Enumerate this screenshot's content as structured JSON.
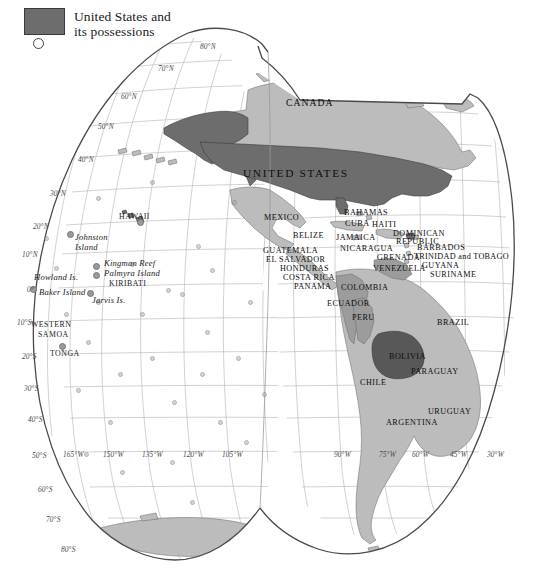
{
  "legend": {
    "swatch_color": "#6d6d6d",
    "label": "United States and\nits possessions",
    "circle_symbol": "small-open-circle"
  },
  "map": {
    "title_region": "Americas and Pacific",
    "projection": "interrupted pseudocylindrical (Goode-style)",
    "colors": {
      "us_possessions": "#6d6d6d",
      "other_land": "#b9b9b9",
      "highlight_bolivia": "#5a5a5a",
      "ocean": "#ffffff",
      "graticule": "#aaaaaa",
      "coastline": "#555555"
    },
    "countries": [
      {
        "name": "CANADA",
        "x": 286,
        "y": 97,
        "size": "mid"
      },
      {
        "name": "UNITED STATES",
        "x": 243,
        "y": 167,
        "size": "big"
      },
      {
        "name": "MEXICO",
        "x": 264,
        "y": 213,
        "size": "normal"
      },
      {
        "name": "BAHAMAS",
        "x": 344,
        "y": 208,
        "size": "normal"
      },
      {
        "name": "CUBA",
        "x": 345,
        "y": 219,
        "size": "normal"
      },
      {
        "name": "HAITI",
        "x": 372,
        "y": 220,
        "size": "normal"
      },
      {
        "name": "DOMINICAN",
        "x": 393,
        "y": 229,
        "size": "normal"
      },
      {
        "name": "REPUBLIC",
        "x": 396,
        "y": 237,
        "size": "normal"
      },
      {
        "name": "BELIZE",
        "x": 293,
        "y": 231,
        "size": "normal"
      },
      {
        "name": "JAMAICA",
        "x": 336,
        "y": 233,
        "size": "normal"
      },
      {
        "name": "GUATEMALA",
        "x": 263,
        "y": 246,
        "size": "normal"
      },
      {
        "name": "NICARAGUA",
        "x": 340,
        "y": 244,
        "size": "normal"
      },
      {
        "name": "EL SALVADOR",
        "x": 266,
        "y": 255,
        "size": "normal"
      },
      {
        "name": "HONDURAS",
        "x": 280,
        "y": 264,
        "size": "normal"
      },
      {
        "name": "COSTA RICA",
        "x": 283,
        "y": 273,
        "size": "normal"
      },
      {
        "name": "PANAMA",
        "x": 294,
        "y": 282,
        "size": "normal"
      },
      {
        "name": "BARBADOS",
        "x": 417,
        "y": 243,
        "size": "normal"
      },
      {
        "name": "TRINIDAD and TOBAGO",
        "x": 414,
        "y": 252,
        "size": "normal"
      },
      {
        "name": "GRENADA",
        "x": 377,
        "y": 253,
        "size": "normal"
      },
      {
        "name": "GUYANA",
        "x": 422,
        "y": 261,
        "size": "normal"
      },
      {
        "name": "SURINAME",
        "x": 430,
        "y": 270,
        "size": "normal"
      },
      {
        "name": "VENEZUELA",
        "x": 373,
        "y": 264,
        "size": "normal"
      },
      {
        "name": "COLOMBIA",
        "x": 341,
        "y": 283,
        "size": "normal"
      },
      {
        "name": "ECUADOR",
        "x": 327,
        "y": 299,
        "size": "normal"
      },
      {
        "name": "PERU",
        "x": 352,
        "y": 313,
        "size": "normal"
      },
      {
        "name": "BRAZIL",
        "x": 437,
        "y": 318,
        "size": "normal"
      },
      {
        "name": "BOLIVIA",
        "x": 389,
        "y": 352,
        "size": "normal"
      },
      {
        "name": "PARAGUAY",
        "x": 411,
        "y": 367,
        "size": "normal"
      },
      {
        "name": "CHILE",
        "x": 360,
        "y": 378,
        "size": "normal"
      },
      {
        "name": "URUGUAY",
        "x": 428,
        "y": 407,
        "size": "normal"
      },
      {
        "name": "ARGENTINA",
        "x": 386,
        "y": 418,
        "size": "normal"
      }
    ],
    "islands": [
      {
        "name": "HAWAII",
        "x": 119,
        "y": 212,
        "style": "caps",
        "dot_x": 137,
        "dot_y": 219
      },
      {
        "name": "Johnston",
        "x": 75,
        "y": 232,
        "style": "italic",
        "dot_x": 67,
        "dot_y": 231
      },
      {
        "name": "Island",
        "x": 75,
        "y": 242,
        "style": "italic"
      },
      {
        "name": "Kingman Reef",
        "x": 104,
        "y": 258,
        "style": "italic",
        "dot_x": 93,
        "dot_y": 263
      },
      {
        "name": "Palmyra Island",
        "x": 104,
        "y": 268,
        "style": "italic",
        "dot_x": 93,
        "dot_y": 272
      },
      {
        "name": "KIRIBATI",
        "x": 109,
        "y": 279,
        "style": "caps"
      },
      {
        "name": "Howland Is.",
        "x": 34,
        "y": 272,
        "style": "italic"
      },
      {
        "name": "Baker Island",
        "x": 39,
        "y": 287,
        "style": "italic",
        "dot_x": 30,
        "dot_y": 286
      },
      {
        "name": "Jarvis Is.",
        "x": 92,
        "y": 295,
        "style": "italic",
        "dot_x": 87,
        "dot_y": 290
      },
      {
        "name": "WESTERN",
        "x": 31,
        "y": 320,
        "style": "caps"
      },
      {
        "name": "SAMOA",
        "x": 38,
        "y": 330,
        "style": "caps"
      },
      {
        "name": "TONGA",
        "x": 50,
        "y": 349,
        "style": "caps",
        "dot_x": 59,
        "dot_y": 343
      }
    ],
    "latitude_labels": [
      {
        "text": "80°N",
        "x": 200,
        "y": 42
      },
      {
        "text": "70°N",
        "x": 158,
        "y": 64
      },
      {
        "text": "60°N",
        "x": 121,
        "y": 92
      },
      {
        "text": "50°N",
        "x": 98,
        "y": 122
      },
      {
        "text": "40°N",
        "x": 78,
        "y": 155
      },
      {
        "text": "30°N",
        "x": 50,
        "y": 189
      },
      {
        "text": "20°N",
        "x": 33,
        "y": 222
      },
      {
        "text": "10°N",
        "x": 22,
        "y": 250
      },
      {
        "text": "0°",
        "x": 27,
        "y": 285
      },
      {
        "text": "10°S",
        "x": 17,
        "y": 318
      },
      {
        "text": "20°S",
        "x": 22,
        "y": 352
      },
      {
        "text": "30°S",
        "x": 24,
        "y": 384
      },
      {
        "text": "40°S",
        "x": 28,
        "y": 415
      },
      {
        "text": "50°S",
        "x": 32,
        "y": 451
      },
      {
        "text": "60°S",
        "x": 38,
        "y": 485
      },
      {
        "text": "70°S",
        "x": 46,
        "y": 515
      },
      {
        "text": "80°S",
        "x": 61,
        "y": 545
      }
    ],
    "longitude_labels": [
      {
        "text": "165°W",
        "x": 63,
        "y": 450
      },
      {
        "text": "150°W",
        "x": 103,
        "y": 450
      },
      {
        "text": "135°W",
        "x": 142,
        "y": 450
      },
      {
        "text": "120°W",
        "x": 183,
        "y": 450
      },
      {
        "text": "105°W",
        "x": 222,
        "y": 450
      },
      {
        "text": "90°W",
        "x": 334,
        "y": 450
      },
      {
        "text": "75°W",
        "x": 379,
        "y": 450
      },
      {
        "text": "60°W",
        "x": 412,
        "y": 450
      },
      {
        "text": "45°W",
        "x": 450,
        "y": 450
      },
      {
        "text": "30°W",
        "x": 487,
        "y": 450
      }
    ]
  }
}
